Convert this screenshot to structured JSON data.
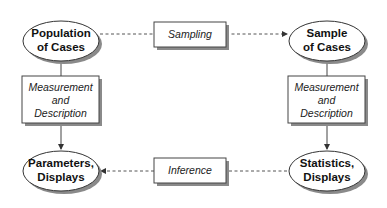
{
  "diagram": {
    "nodes": {
      "population": {
        "line1": "Population",
        "line2": "of Cases"
      },
      "sample": {
        "line1": "Sample",
        "line2": "of Cases"
      },
      "parameters": {
        "line1": "Parameters,",
        "line2": "Displays"
      },
      "statistics": {
        "line1": "Statistics,",
        "line2": "Displays"
      }
    },
    "processes": {
      "sampling": {
        "label": "Sampling"
      },
      "inference": {
        "label": "Inference"
      },
      "measurement_left": {
        "line1": "Measurement",
        "line2": "and",
        "line3": "Description"
      },
      "measurement_right": {
        "line1": "Measurement",
        "line2": "and",
        "line3": "Description"
      }
    },
    "edges": [
      {
        "from": "population",
        "to": "sample",
        "via": "sampling",
        "style": "dashed"
      },
      {
        "from": "population",
        "to": "parameters",
        "via": "measurement_left",
        "style": "solid"
      },
      {
        "from": "sample",
        "to": "statistics",
        "via": "measurement_right",
        "style": "solid"
      },
      {
        "from": "statistics",
        "to": "parameters",
        "via": "inference",
        "style": "dashed"
      }
    ],
    "colors": {
      "line": "#444444",
      "shadow": "#8a8a8a",
      "fill": "#ffffff",
      "text": "#111111"
    }
  }
}
